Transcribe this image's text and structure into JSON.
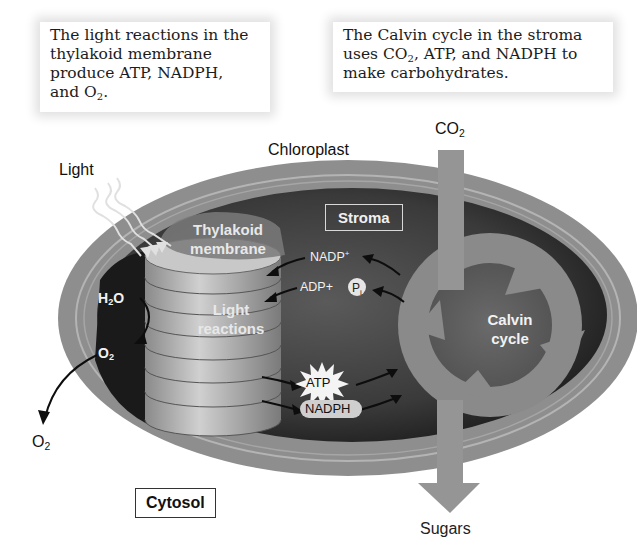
{
  "captions": {
    "left": {
      "line1": "The light reactions in the",
      "line2": "thylakoid membrane",
      "line3": "produce ATP, NADPH,",
      "line4_prefix": "and O",
      "line4_sub": "2",
      "line4_suffix": "."
    },
    "right": {
      "line1": "The Calvin cycle in the stroma",
      "line2_prefix": "uses CO",
      "line2_sub": "2",
      "line2_suffix": ", ATP, and NADPH to",
      "line3": "make carbohydrates."
    }
  },
  "labels": {
    "chloroplast": "Chloroplast",
    "light": "Light",
    "co2_input": {
      "main": "CO",
      "sub": "2"
    },
    "stroma": "Stroma",
    "thylakoid_membrane": {
      "line1": "Thylakoid",
      "line2": "membrane"
    },
    "light_reactions": {
      "line1": "Light",
      "line2": "reactions"
    },
    "calvin_cycle": {
      "line1": "Calvin",
      "line2": "cycle"
    },
    "nadp_plus": {
      "main": "NADP",
      "sup": "+"
    },
    "adp_plus": "ADP+",
    "pi": {
      "main": "P",
      "sub": "i"
    },
    "atp": "ATP",
    "nadph": "NADPH",
    "h2o": {
      "pre": "H",
      "sub": "2",
      "post": "O"
    },
    "o2_inner": {
      "main": "O",
      "sub": "2"
    },
    "o2_released": {
      "main": "O",
      "sub": "2"
    },
    "cytosol": "Cytosol",
    "sugars": "Sugars"
  },
  "colors": {
    "outer_membrane": "#8a8a8a",
    "stroma_fill": "#3e3e3e",
    "thylakoid_disc": "#b0b0b0",
    "calvin_ring": "#8c8c8c",
    "arrow": "#111111",
    "background": "#ffffff"
  }
}
